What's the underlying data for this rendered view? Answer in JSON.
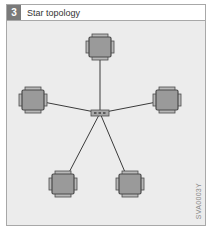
{
  "header": {
    "number": "3",
    "title": "Star topology"
  },
  "diagram": {
    "type": "star-topology",
    "hub": {
      "label": "hub",
      "x": 100,
      "y": 113
    },
    "nodes": [
      {
        "id": "node-top",
        "x": 100,
        "y": 47
      },
      {
        "id": "node-left",
        "x": 33,
        "y": 100
      },
      {
        "id": "node-right",
        "x": 167,
        "y": 100
      },
      {
        "id": "node-bottom-left",
        "x": 63,
        "y": 184
      },
      {
        "id": "node-bottom-right",
        "x": 130,
        "y": 184
      }
    ],
    "colors": {
      "background": "#ececec",
      "node_fill": "#9a9a9a",
      "node_border": "#4a4a4a",
      "line": "#3a3a3a"
    }
  },
  "figure_code": "SVA0003Y"
}
